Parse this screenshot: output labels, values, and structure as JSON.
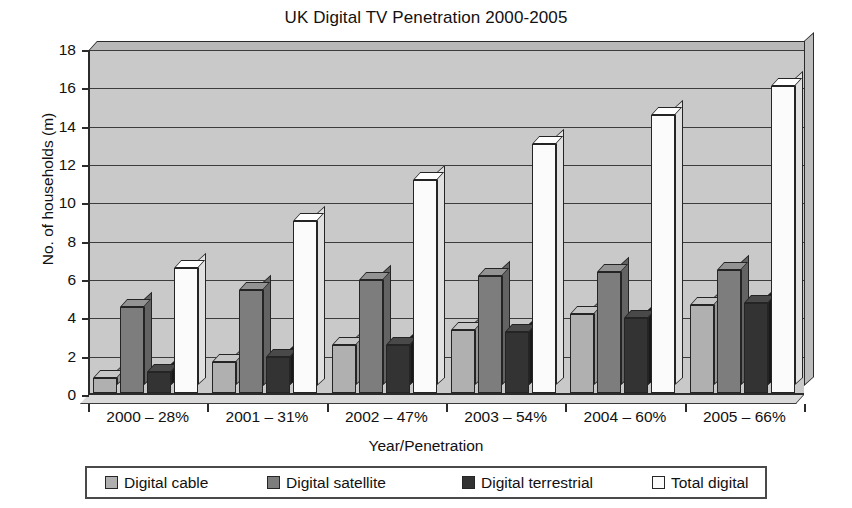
{
  "chart_data": {
    "type": "bar",
    "title": "UK Digital TV Penetration 2000-2005",
    "xlabel": "Year/Penetration",
    "ylabel": "No. of households (m)",
    "categories": [
      "2000 – 28%",
      "2001 – 31%",
      "2002 – 47%",
      "2003 – 54%",
      "2004 – 60%",
      "2005 – 66%"
    ],
    "series": [
      {
        "name": "Digital cable",
        "color": "#b0b0b0",
        "values": [
          0.8,
          1.6,
          2.5,
          3.3,
          4.1,
          4.6
        ]
      },
      {
        "name": "Digital satellite",
        "color": "#7d7d7d",
        "values": [
          4.5,
          5.4,
          5.9,
          6.1,
          6.3,
          6.4
        ]
      },
      {
        "name": "Digital terrestrial",
        "color": "#333333",
        "values": [
          1.1,
          1.9,
          2.5,
          3.2,
          3.9,
          4.7
        ]
      },
      {
        "name": "Total digital",
        "color": "#fbfbfb",
        "values": [
          6.5,
          9.0,
          11.1,
          13.0,
          14.5,
          16.0
        ]
      }
    ],
    "ylim": [
      0,
      18
    ],
    "yticks": [
      0,
      2,
      4,
      6,
      8,
      10,
      12,
      14,
      16,
      18
    ],
    "grid": true,
    "legend_position": "bottom",
    "plot_background": "#c9c9c9",
    "axis_color": "#2b2b2b"
  }
}
